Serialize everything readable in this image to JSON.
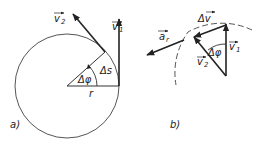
{
  "figure": {
    "panel_a": {
      "caption": "a)",
      "labels": {
        "v1": "v",
        "v1_sub": "1",
        "v2": "v",
        "v2_sub": "2",
        "delta_phi": "Δφ",
        "delta_s": "Δs",
        "radius": "r"
      }
    },
    "panel_b": {
      "caption": "b)",
      "labels": {
        "delta_v": "Δv",
        "a_r": "a",
        "a_r_sub": "r",
        "v1": "v",
        "v1_sub": "1",
        "v2": "v",
        "v2_sub": "2",
        "delta_phi": "Δφ"
      }
    },
    "colors": {
      "stroke": "#333333",
      "circle": "#555555",
      "background": "#ffffff"
    }
  }
}
